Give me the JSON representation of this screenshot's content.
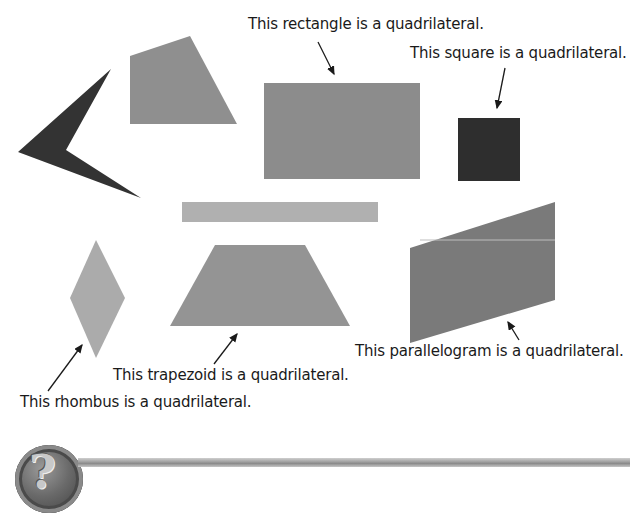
{
  "labels": {
    "rectangle": "This rectangle is a quadrilateral.",
    "square": "This square is a quadrilateral.",
    "parallelogram": "This parallelogram is a quadrilateral.",
    "trapezoid": "This trapezoid is a quadrilateral.",
    "rhombus": "This rhombus is a quadrilateral."
  },
  "footer": {
    "icon": "question-mark-icon",
    "icon_glyph": "?"
  },
  "colors": {
    "dark_shape": "#333333",
    "medium_shape": "#8c8c8c",
    "light_shape": "#ababab",
    "text": "#1a1a1a"
  }
}
